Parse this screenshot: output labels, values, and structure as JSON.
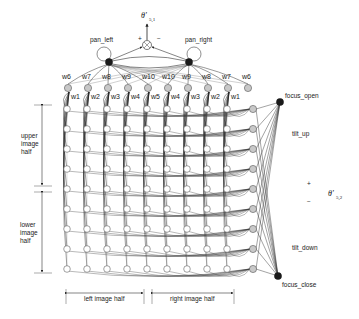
{
  "diagram": {
    "output_top": {
      "label": "θ'",
      "subscript": "5,1",
      "plus": "+",
      "minus": "−"
    },
    "output_right": {
      "label": "θ'",
      "subscript": "5,2",
      "plus": "+",
      "minus": "−"
    },
    "nodes": {
      "pan_left": "pan_left",
      "pan_right": "pan_right",
      "focus_open": "focus_open",
      "focus_close": "focus_close",
      "tilt_up": "tilt_up",
      "tilt_down": "tilt_down"
    },
    "top_weights": [
      "w6",
      "w7",
      "w8",
      "w9",
      "w10",
      "w10",
      "w9",
      "w8",
      "w7",
      "w6"
    ],
    "lower_weights": [
      "w1",
      "w2",
      "w3",
      "w4",
      "w5",
      "w4",
      "w3",
      "w2",
      "w1"
    ],
    "axis_labels": {
      "upper_half": [
        "upper",
        "image",
        "half"
      ],
      "lower_half": [
        "lower",
        "image",
        "half"
      ],
      "left_half": "left image half",
      "right_half": "right image half"
    },
    "grid": {
      "columns": 9,
      "rows": 9
    },
    "colors": {
      "line": "#333333",
      "node_dark": "#1a1a1a",
      "node_gray": "#c8c8c8",
      "node_hollow": "#ffffff"
    }
  }
}
